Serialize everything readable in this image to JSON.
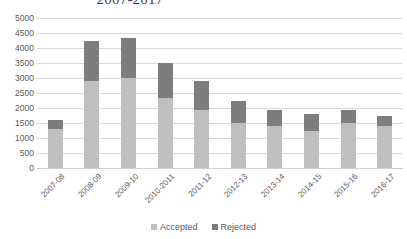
{
  "chart_data": {
    "type": "bar",
    "title": "2007-2017",
    "xlabel": "",
    "ylabel": "",
    "ylim": [
      0,
      5000
    ],
    "ytick_step": 500,
    "yticks": [
      "5000",
      "4500",
      "4000",
      "3500",
      "3000",
      "2500",
      "2000",
      "1500",
      "1000",
      "500",
      "0"
    ],
    "grid": true,
    "stacked": true,
    "legend_position": "bottom",
    "categories": [
      "2007-08",
      "2008-09",
      "2009-10",
      "2010-2011",
      "2011-12",
      "2012-13",
      "2013-14",
      "2014-15",
      "2015-16",
      "2016-17"
    ],
    "series": [
      {
        "name": "Accepted",
        "color": "#bfbfbf",
        "values": [
          1300,
          2900,
          3000,
          2350,
          1950,
          1500,
          1400,
          1250,
          1500,
          1400
        ]
      },
      {
        "name": "Rejected",
        "color": "#7d7d7d",
        "values": [
          300,
          1350,
          1350,
          1150,
          950,
          750,
          550,
          550,
          450,
          350
        ]
      }
    ],
    "totals": [
      1600,
      4250,
      4350,
      3500,
      2900,
      2250,
      1950,
      1800,
      1950,
      1750
    ]
  },
  "legend": {
    "items": [
      {
        "label": "Accepted",
        "color": "#bfbfbf"
      },
      {
        "label": "Rejected",
        "color": "#7d7d7d"
      }
    ]
  }
}
